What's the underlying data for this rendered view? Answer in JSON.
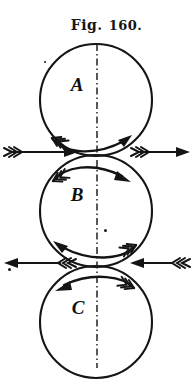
{
  "figure": {
    "caption_prefix": "Fig.",
    "caption_number": "160.",
    "caption_full": "Fig. 160.",
    "background_color": "#ffffff",
    "ink_color": "#161616"
  },
  "circles": [
    {
      "id": "A",
      "label": "A",
      "center_x": 96,
      "center_y": 100,
      "radius": 56,
      "rotation": "clockwise",
      "label_offset_x": -20,
      "label_offset_y": -12
    },
    {
      "id": "B",
      "label": "B",
      "center_x": 96,
      "center_y": 211,
      "radius": 56,
      "rotation": "counterclockwise",
      "label_offset_x": -20,
      "label_offset_y": -12
    },
    {
      "id": "C",
      "label": "C",
      "center_x": 96,
      "center_y": 322,
      "radius": 56,
      "rotation": "counterclockwise",
      "label_offset_x": -20,
      "label_offset_y": -12
    }
  ],
  "centerline": {
    "name": "vertical-axis-dashed",
    "x": 97,
    "y_top": 44,
    "y_bottom": 368,
    "style": "dash-dot"
  },
  "curved_arrows": [
    {
      "name": "rotation-arrow-a-bottom",
      "circle": "A",
      "position": "bottom-interior",
      "direction": "right",
      "meaning": "A rotates clockwise"
    },
    {
      "name": "rotation-arrow-b-top",
      "circle": "B",
      "position": "top-interior",
      "direction": "right",
      "meaning": "surface of B moves right at top"
    },
    {
      "name": "rotation-arrow-b-bottom",
      "circle": "B",
      "position": "bottom-interior",
      "direction": "left",
      "meaning": "surface of B moves left at bottom"
    },
    {
      "name": "rotation-arrow-c-top",
      "circle": "C",
      "position": "top-interior",
      "direction": "left",
      "meaning": "C rotates counterclockwise"
    }
  ],
  "straight_arrows": [
    {
      "name": "velocity-arrow-ab-left",
      "junction": "A-B",
      "y": 152,
      "x_start": 4,
      "x_end": 76,
      "direction": "right",
      "fletched_end": "left"
    },
    {
      "name": "velocity-arrow-ab-right",
      "junction": "A-B",
      "y": 152,
      "x_start": 130,
      "x_end": 190,
      "direction": "right",
      "fletched_end": "left"
    },
    {
      "name": "velocity-arrow-bc-left",
      "junction": "B-C",
      "y": 263,
      "x_start": 4,
      "x_end": 76,
      "direction": "left",
      "fletched_end": "right"
    },
    {
      "name": "velocity-arrow-bc-right",
      "junction": "B-C",
      "y": 263,
      "x_start": 130,
      "x_end": 190,
      "direction": "left",
      "fletched_end": "right"
    }
  ],
  "specks": [
    {
      "name": "ink-speck-1",
      "x": 104,
      "y": 229,
      "size": 3
    },
    {
      "name": "ink-speck-2",
      "x": 8,
      "y": 268,
      "size": 3
    },
    {
      "name": "ink-speck-3",
      "x": 44,
      "y": 61,
      "size": 2
    }
  ]
}
